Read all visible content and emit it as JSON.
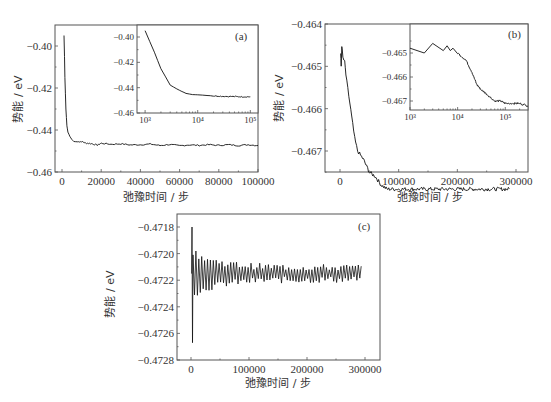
{
  "chart_data": [
    {
      "id": "a",
      "type": "line",
      "panel_label": "(a)",
      "xlabel": "弛豫时间 / 步",
      "ylabel": "势能 / eV",
      "xlim": [
        0,
        100000
      ],
      "ylim": [
        -0.46,
        -0.39
      ],
      "xticks": [
        "0",
        "20000",
        "40000",
        "60000",
        "80000",
        "100000"
      ],
      "yticks": [
        "-0.40",
        "-0.42",
        "-0.44",
        "-0.46"
      ],
      "grid": false,
      "series": [
        {
          "name": "main",
          "x": [
            1000,
            1500,
            2000,
            2500,
            3000,
            4000,
            5000,
            6000,
            8000,
            10000,
            12000,
            15000,
            18000,
            20000,
            25000,
            30000,
            35000,
            40000,
            45000,
            50000,
            55000,
            60000,
            65000,
            70000,
            75000,
            80000,
            85000,
            90000,
            95000,
            100000
          ],
          "y": [
            -0.395,
            -0.415,
            -0.43,
            -0.438,
            -0.441,
            -0.443,
            -0.4445,
            -0.4455,
            -0.4456,
            -0.4455,
            -0.4462,
            -0.4465,
            -0.4472,
            -0.4463,
            -0.4468,
            -0.4466,
            -0.4471,
            -0.447,
            -0.4467,
            -0.4474,
            -0.4469,
            -0.4475,
            -0.4471,
            -0.4473,
            -0.447,
            -0.4473,
            -0.447,
            -0.4474,
            -0.447,
            -0.4474
          ]
        }
      ],
      "inset": {
        "xscale": "log",
        "xlim": [
          800,
          150000
        ],
        "ylim": [
          -0.46,
          -0.395
        ],
        "xticks": [
          "10³",
          "10⁴",
          "10⁵"
        ],
        "yticks": [
          "-0.40",
          "-0.42",
          "-0.44",
          "-0.46"
        ],
        "x": [
          1000,
          1500,
          2000,
          3000,
          4000,
          5000,
          6000,
          8000,
          10000,
          15000,
          20000,
          30000,
          50000,
          70000,
          100000
        ],
        "y": [
          -0.395,
          -0.412,
          -0.425,
          -0.438,
          -0.441,
          -0.443,
          -0.4445,
          -0.4455,
          -0.4456,
          -0.4462,
          -0.4465,
          -0.4468,
          -0.447,
          -0.4472,
          -0.4472
        ]
      }
    },
    {
      "id": "b",
      "type": "line",
      "panel_label": "(b)",
      "xlabel": "弛豫时间 / 步",
      "ylabel": "势能 / eV",
      "xlim": [
        0,
        300000
      ],
      "ylim": [
        -0.4675,
        -0.464
      ],
      "xticks": [
        "0",
        "100000",
        "200000",
        "300000"
      ],
      "yticks": [
        "-0.464",
        "-0.465",
        "-0.466",
        "-0.467"
      ],
      "grid": false,
      "series": [
        {
          "name": "main",
          "x": [
            1000,
            2000,
            3000,
            5000,
            8000,
            10000,
            15000,
            20000,
            25000,
            30000,
            35000,
            40000,
            50000,
            60000,
            70000,
            80000,
            100000,
            120000,
            150000,
            180000,
            200000,
            230000,
            260000,
            290000
          ],
          "y": [
            -0.4647,
            -0.465,
            -0.4645,
            -0.4648,
            -0.4649,
            -0.4652,
            -0.4657,
            -0.4662,
            -0.4667,
            -0.467,
            -0.4671,
            -0.4672,
            -0.4675,
            -0.4676,
            -0.4678,
            -0.4679,
            -0.4679,
            -0.4679,
            -0.4679,
            -0.4679,
            -0.4679,
            -0.4679,
            -0.4679,
            -0.4679
          ]
        }
      ],
      "inset": {
        "xscale": "log",
        "xlim": [
          1000,
          300000
        ],
        "ylim": [
          -0.4675,
          -0.4644
        ],
        "xticks": [
          "10³",
          "10⁴",
          "10⁵"
        ],
        "yticks": [
          "-0.465",
          "-0.466",
          "-0.467"
        ],
        "x": [
          1000,
          2000,
          3000,
          5000,
          6000,
          7000,
          8000,
          10000,
          15000,
          20000,
          25000,
          30000,
          40000,
          60000,
          80000,
          100000,
          150000,
          200000,
          300000
        ],
        "y": [
          -0.4648,
          -0.465,
          -0.4646,
          -0.4649,
          -0.4647,
          -0.4649,
          -0.4648,
          -0.465,
          -0.4653,
          -0.4658,
          -0.4663,
          -0.4665,
          -0.4667,
          -0.467,
          -0.467,
          -0.4671,
          -0.4671,
          -0.4671,
          -0.4672
        ]
      }
    },
    {
      "id": "c",
      "type": "line",
      "panel_label": "(c)",
      "xlabel": "弛豫时间 / 步",
      "ylabel": "势能 / eV",
      "xlim": [
        0,
        300000
      ],
      "ylim": [
        -0.4728,
        -0.4717
      ],
      "xticks": [
        "0",
        "100000",
        "200000",
        "300000"
      ],
      "yticks": [
        "-0.4718",
        "-0.4720",
        "-0.4722",
        "-0.4724",
        "-0.4726",
        "-0.4728"
      ],
      "grid": false,
      "series": [
        {
          "name": "main",
          "description": "damped oscillation around -0.47215 eV; initial spike from -0.4718 to -0.47267 near step 0, amplitude decays to ~±0.00005 after ~150000 steps",
          "center": -0.47215,
          "initial_max": -0.4718,
          "initial_min": -0.47267,
          "x_end": 295000
        }
      ]
    }
  ],
  "axis_font_note": "tick labels in serif"
}
